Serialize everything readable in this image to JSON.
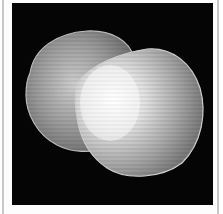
{
  "image": {
    "subject": "two overlapping shells",
    "background_color": "#050505",
    "frame_color": "#fdfdfd",
    "border_color": "#c8c8c8"
  }
}
